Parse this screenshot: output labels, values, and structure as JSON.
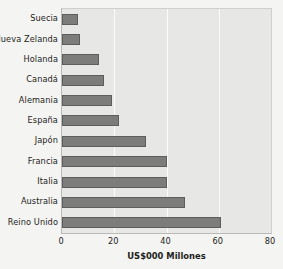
{
  "chart_data": {
    "type": "bar",
    "orientation": "horizontal",
    "title": "",
    "xlabel": "US$000 Millones",
    "ylabel": "",
    "categories": [
      "Suecia",
      "Nueva Zelanda",
      "Holanda",
      "Canadá",
      "Alemania",
      "España",
      "Japón",
      "Francia",
      "Italia",
      "Australia",
      "Reino Unido"
    ],
    "values": [
      6,
      7,
      14,
      16,
      19,
      22,
      32,
      40,
      40,
      47,
      61
    ],
    "xlim": [
      0,
      80
    ],
    "xticks": [
      0,
      20,
      40,
      60,
      80
    ],
    "xtick_labels": [
      "0",
      "20",
      "40",
      "60",
      "80"
    ],
    "gridlines": [
      20,
      40,
      60
    ],
    "grid": true,
    "legend": null,
    "colors": {
      "bar_fill": "#7c7c7a",
      "bar_edge": "#5d5d5b",
      "plot_background": "#e7e7e5",
      "page_background": "#f4f4f2",
      "gridline": "#fbfbfa",
      "axis": "#b9b9b7",
      "text": "#1d1d1b"
    }
  }
}
